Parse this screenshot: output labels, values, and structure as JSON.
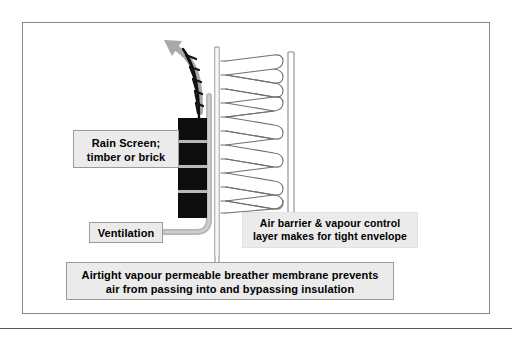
{
  "page": {
    "background": "#ffffff",
    "rule_color": "#5a5a5a"
  },
  "frame": {
    "border_color": "#888888",
    "fill": "#ffffff"
  },
  "callouts": {
    "rain_screen": {
      "name": "rain-screen-callout",
      "line1": "Rain Screen;",
      "line2": "timber or brick",
      "fill": "#ebebeb",
      "border": "#9a9a9a"
    },
    "ventilation": {
      "name": "ventilation-callout",
      "line1": "Ventilation",
      "fill": "#ebebeb",
      "border": "#9a9a9a"
    },
    "air_barrier": {
      "name": "air-barrier-callout",
      "line1": "Air barrier & vapour control",
      "line2": "layer makes for tight envelope",
      "fill": "#ebebeb",
      "border": "#e2e2e2"
    },
    "membrane": {
      "name": "breather-membrane-callout",
      "line1": "Airtight vapour permeable breather membrane prevents",
      "line2": "air from passing into and bypassing insulation",
      "fill": "#ebebeb",
      "border": "#9a9a9a"
    }
  },
  "graphics": {
    "cladding_blocks": {
      "label": "rain screen cladding blocks",
      "color": "#0d0d0d",
      "mortar_color": "#b9b9b9",
      "count": 4
    },
    "airflow_arrow": {
      "label": "ventilation airflow arrow",
      "color": "#a8a8a8",
      "direction": "up-left"
    },
    "vent_path": {
      "label": "ventilation cavity path",
      "color": "#b0b0b0"
    },
    "sawtooth": {
      "label": "battens sawtooth line",
      "color": "#111111"
    },
    "breather_membrane_line": {
      "label": "breather membrane vertical line",
      "color": "#8d8d8d"
    },
    "insulation": {
      "label": "insulation quilt coil",
      "color": "#6f6f6f",
      "loops": 10
    },
    "air_barrier_lines": {
      "label": "air barrier vapour control layer lines",
      "color": "#8d8d8d",
      "count": 2
    }
  }
}
